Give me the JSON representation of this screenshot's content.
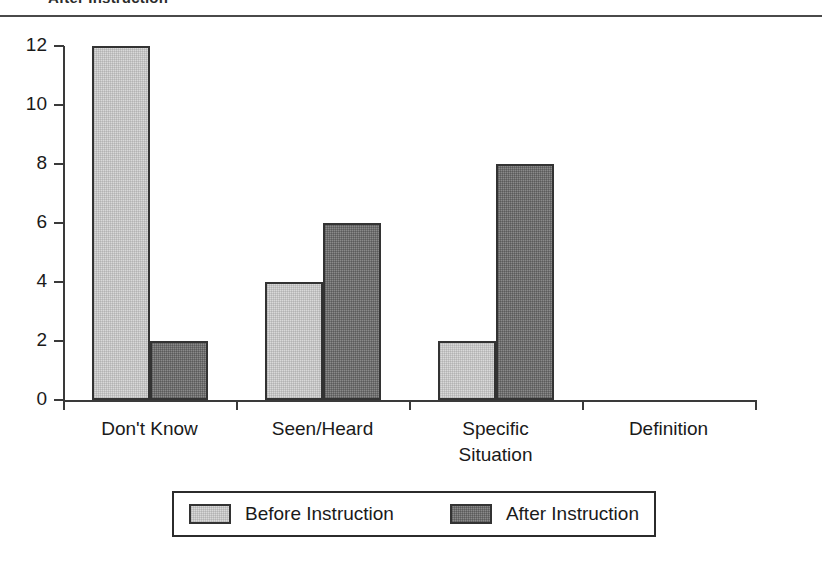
{
  "header": {
    "clipped_title": "After Instruction",
    "rule_color": "#4a4a4a"
  },
  "chart_data": {
    "type": "bar",
    "title": "",
    "subtitle": "",
    "xlabel": "",
    "ylabel": "",
    "ylim": [
      0,
      12
    ],
    "y_ticks": [
      0,
      2,
      4,
      6,
      8,
      10,
      12
    ],
    "grid": false,
    "legend_position": "bottom",
    "categories": [
      "Don't Know",
      "Seen/Heard",
      "Specific\nSituation",
      "Definition"
    ],
    "category_lines": [
      [
        "Don't Know"
      ],
      [
        "Seen/Heard"
      ],
      [
        "Specific",
        "Situation"
      ],
      [
        "Definition"
      ]
    ],
    "series": [
      {
        "name": "Before Instruction",
        "color": "#d9d9d9",
        "values": [
          12,
          4,
          2,
          0
        ]
      },
      {
        "name": "After Instruction",
        "color": "#8a8a8a",
        "values": [
          2,
          6,
          8,
          0
        ]
      }
    ]
  },
  "legend": {
    "entries": [
      {
        "label": "Before Instruction",
        "swatch": "series-before"
      },
      {
        "label": "After Instruction",
        "swatch": "series-after"
      }
    ]
  },
  "colors": {
    "axis": "#3a3a3a",
    "text": "#1a1a1a",
    "bar_outline": "#333333",
    "before": "#d9d9d9",
    "after": "#8a8a8a"
  }
}
